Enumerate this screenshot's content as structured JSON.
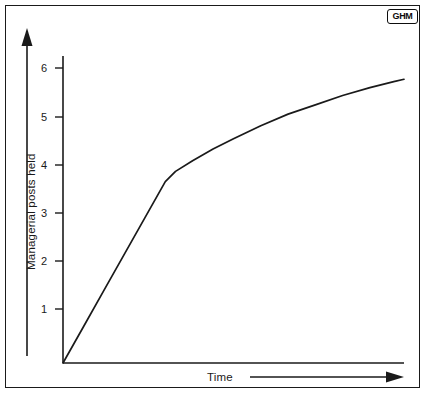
{
  "figure": {
    "logo_badge": "GHM",
    "background_color": "#ffffff",
    "line_color": "#1a1a1a",
    "frame_color": "#1a1a1a"
  },
  "chart_data": {
    "type": "line",
    "title": "",
    "subtitle": "",
    "xlabel": "Time",
    "ylabel": "Managerial posts held",
    "xticklabels": [],
    "yticklabels": [
      "1",
      "2",
      "3",
      "4",
      "5",
      "6"
    ],
    "ytickvalues": [
      1,
      2,
      3,
      4,
      5,
      6
    ],
    "xlim": [
      0,
      10
    ],
    "ylim": [
      0,
      6.6
    ],
    "grid": false,
    "legend": null,
    "annotations": [],
    "axis_style": {
      "x_axis_arrow": true,
      "y_axis_arrow": true,
      "x_axis_label_arrow": true,
      "tick_direction": "out"
    },
    "series": [
      {
        "name": "Managerial posts held",
        "x": [
          0.0,
          0.6,
          1.2,
          1.8,
          2.4,
          3.0,
          3.3,
          3.8,
          4.4,
          5.0,
          5.8,
          6.6,
          7.4,
          8.2,
          9.0,
          9.7,
          10.0
        ],
        "values": [
          0.0,
          0.78,
          1.56,
          2.34,
          3.12,
          3.9,
          4.12,
          4.35,
          4.6,
          4.82,
          5.1,
          5.35,
          5.55,
          5.75,
          5.92,
          6.05,
          6.1
        ]
      }
    ]
  }
}
